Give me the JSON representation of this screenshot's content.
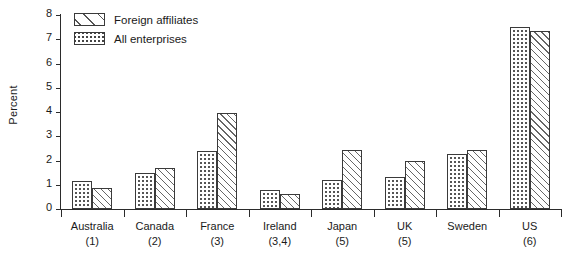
{
  "chart_data": {
    "type": "bar",
    "title": "",
    "xlabel": "",
    "ylabel": "Percent",
    "ylim": [
      0,
      8
    ],
    "ytick_step": 1,
    "yticks": [
      "8",
      "7",
      "6",
      "5",
      "4",
      "3",
      "2",
      "1",
      "0"
    ],
    "grid": false,
    "legend_position": "top-left",
    "categories": [
      "Australia",
      "Canada",
      "France",
      "Ireland",
      "Japan",
      "UK",
      "Sweden",
      "US"
    ],
    "category_notes": [
      "(1)",
      "(2)",
      "(3)",
      "(3,4)",
      "(5)",
      "(5)",
      "",
      "(6)"
    ],
    "series": [
      {
        "name": "All enterprises",
        "pattern": "dotted",
        "values": [
          1.15,
          1.5,
          2.4,
          0.8,
          1.2,
          1.3,
          2.25,
          7.5
        ]
      },
      {
        "name": "Foreign affiliates",
        "pattern": "hatched",
        "values": [
          0.85,
          1.7,
          3.95,
          0.6,
          2.45,
          2.0,
          2.45,
          7.35
        ]
      }
    ],
    "legend_order": [
      "Foreign affiliates",
      "All enterprises"
    ]
  },
  "colors": {
    "axis": "#2b2b2b",
    "bar_outline": "#3a3a3a",
    "pattern": "#555555",
    "background": "#ffffff"
  }
}
